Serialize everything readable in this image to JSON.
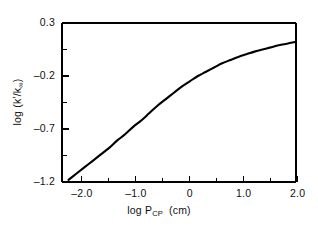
{
  "chart_data": {
    "type": "line",
    "title": "",
    "xlabel": "log P_CP (cm)",
    "xlabel_main": "log P",
    "xlabel_sub": "CP",
    "xlabel_unit": "(cm)",
    "ylabel": "log (k'/k∞)",
    "ylabel_main": "log (k'/k",
    "ylabel_sub": "∞",
    "ylabel_tail": ")",
    "xlim": [
      -2.37,
      1.97
    ],
    "ylim": [
      -1.2,
      0.3
    ],
    "xticks": [
      -2.0,
      -1.0,
      0.0,
      1.0,
      2.0
    ],
    "xtick_labels": [
      "–2.0",
      "–1.0",
      "0",
      "1.0",
      "2.0"
    ],
    "xminor_ticks": [
      -1.5,
      -0.5,
      0.5,
      1.5
    ],
    "yticks": [
      0.3,
      -0.2,
      -0.7,
      -1.2
    ],
    "ytick_labels": [
      "0.3",
      "–0.2",
      "–0.7",
      "–1.2"
    ],
    "yminor_ticks": [
      0.05,
      -0.45,
      -0.95
    ],
    "grid": false,
    "legend": null,
    "line_color": "#000000",
    "line_width": 2.1,
    "frame_color": "#000000",
    "series": [
      {
        "name": "log (k'/k∞) vs log P_CP",
        "x": [
          -2.25,
          -2.1,
          -1.95,
          -1.8,
          -1.65,
          -1.5,
          -1.35,
          -1.2,
          -1.05,
          -0.9,
          -0.75,
          -0.6,
          -0.45,
          -0.3,
          -0.15,
          0.0,
          0.15,
          0.3,
          0.45,
          0.6,
          0.75,
          0.9,
          1.05,
          1.2,
          1.35,
          1.5,
          1.65,
          1.8,
          1.95
        ],
        "y": [
          -1.18,
          -1.12,
          -1.06,
          -1.0,
          -0.94,
          -0.88,
          -0.81,
          -0.75,
          -0.68,
          -0.62,
          -0.55,
          -0.48,
          -0.42,
          -0.36,
          -0.3,
          -0.25,
          -0.2,
          -0.16,
          -0.12,
          -0.08,
          -0.05,
          -0.02,
          0.005,
          0.03,
          0.05,
          0.07,
          0.09,
          0.105,
          0.12
        ]
      }
    ]
  },
  "axes_geometry": {
    "left_px": 62,
    "right_px": 296,
    "top_px": 23,
    "bottom_px": 182
  }
}
